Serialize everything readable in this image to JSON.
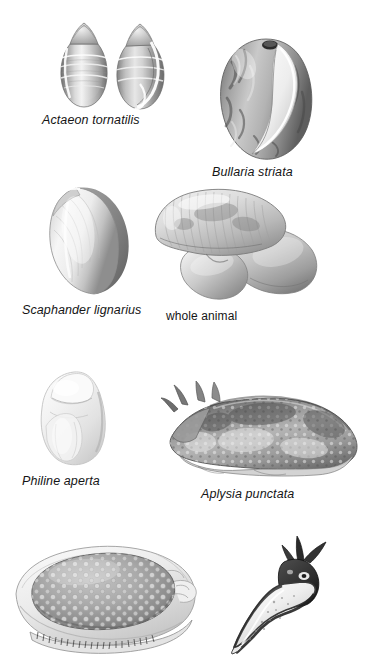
{
  "plate": {
    "title": "Opisthobranch molluscs illustration plate",
    "background_color": "#ffffff",
    "ink_color": "#151515",
    "width": 373,
    "height": 655
  },
  "figures": [
    {
      "id": "actaeon",
      "caption": "Actaeon tornatilis",
      "caption_style": "italic",
      "specimen": "two bullet-shaped spiral shells, apertural and dorsal views",
      "row": 1,
      "column": "left"
    },
    {
      "id": "bullaria",
      "caption": "Bullaria striata",
      "caption_style": "italic",
      "specimen": "ovoid mottled bubble shell with wide aperture",
      "row": 1,
      "column": "right"
    },
    {
      "id": "scaphander-shell",
      "caption": "Scaphander lignarius",
      "caption_style": "italic",
      "specimen": "thin oval barrel-shaped shell",
      "row": 2,
      "column": "left"
    },
    {
      "id": "scaphander-animal",
      "caption": "whole animal",
      "caption_style": "plain",
      "specimen": "whole animal with head shield and body lobes",
      "row": 2,
      "column": "right"
    },
    {
      "id": "philine",
      "caption": "Philine aperta",
      "caption_style": "italic",
      "specimen": "pale rounded translucent slug body",
      "row": 3,
      "column": "left"
    },
    {
      "id": "aplysia",
      "caption": "Aplysia punctata",
      "caption_style": "italic",
      "specimen": "sea hare with rhinophores and mottled dark mantle",
      "row": 3,
      "column": "right"
    },
    {
      "id": "dorid",
      "caption": "",
      "caption_style": "none",
      "specimen": "tuberculate dorid nudibranch, dorsal view, caption cropped",
      "row": 4,
      "column": "left"
    },
    {
      "id": "nudibranch-pale",
      "caption": "",
      "caption_style": "none",
      "specimen": "slender pale nudibranch with dark head and oral tentacles, caption cropped",
      "row": 4,
      "column": "right"
    }
  ]
}
